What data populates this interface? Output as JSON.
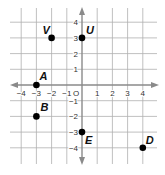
{
  "figure": {
    "type": "coordinate-plane",
    "origin_label": "O",
    "x_range": [
      -4,
      4
    ],
    "y_range": [
      -4,
      4
    ],
    "x_ticks": [
      "-4",
      "-3",
      "-2",
      "-1",
      "1",
      "2",
      "3",
      "4"
    ],
    "y_ticks": [
      "4",
      "3",
      "2",
      "1",
      "-1",
      "-2",
      "-3",
      "-4"
    ],
    "grid": true,
    "colors": {
      "grid": "#b0b0b0",
      "axis": "#8a8a8a",
      "point": "#000000",
      "text": "#222222"
    }
  },
  "points": [
    {
      "label": "V",
      "x": -2,
      "y": 3
    },
    {
      "label": "U",
      "x": 0,
      "y": 3
    },
    {
      "label": "A",
      "x": -3,
      "y": 0
    },
    {
      "label": "B",
      "x": -3,
      "y": -2
    },
    {
      "label": "E",
      "x": 0,
      "y": -3
    },
    {
      "label": "D",
      "x": 4,
      "y": -4
    }
  ]
}
